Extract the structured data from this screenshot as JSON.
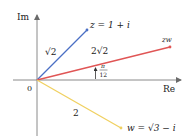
{
  "diagram": {
    "type": "complex-plane-vectors",
    "axes": {
      "horizontal_label": "Re",
      "vertical_label": "Im",
      "origin_label": "0",
      "color": "#8a8a8a"
    },
    "vectors": [
      {
        "name": "z",
        "label": "z = 1 + i",
        "modulus_label": "√2",
        "color": "#4a6fc4",
        "end": [
          87,
          30
        ]
      },
      {
        "name": "zw",
        "label": "zw",
        "modulus_label": "2√2",
        "color": "#e05555",
        "end": [
          170,
          47
        ]
      },
      {
        "name": "w",
        "label": "w = √3 − i",
        "modulus_label": "2",
        "color": "#f0d060",
        "end": [
          121,
          128
        ]
      }
    ],
    "angle": {
      "numerator": "π",
      "denominator": "12",
      "label": "π/12"
    }
  }
}
